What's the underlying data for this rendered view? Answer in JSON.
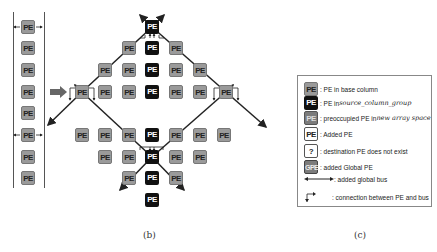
{
  "pe_label": "PE",
  "left_column": {
    "pes": [
      {
        "y": 27,
        "global": true
      },
      {
        "y": 48,
        "global": false
      },
      {
        "y": 70,
        "global": false
      },
      {
        "y": 92,
        "global": false
      },
      {
        "y": 113,
        "global": false
      },
      {
        "y": 135,
        "global": true
      },
      {
        "y": 157,
        "global": false
      },
      {
        "y": 178,
        "global": false
      }
    ]
  },
  "main_diagram": {
    "global_nodes": [
      {
        "name": "top",
        "x": 152,
        "y": 27,
        "type": "src"
      },
      {
        "name": "left",
        "x": 82,
        "y": 92,
        "type": "base"
      },
      {
        "name": "right",
        "x": 226,
        "y": 92,
        "type": "base"
      },
      {
        "name": "bottom",
        "x": 152,
        "y": 157,
        "type": "src"
      }
    ],
    "pes": [
      {
        "x": 129,
        "y": 48,
        "type": "base"
      },
      {
        "x": 152,
        "y": 48,
        "type": "src"
      },
      {
        "x": 176,
        "y": 48,
        "type": "base"
      },
      {
        "x": 105,
        "y": 70,
        "type": "base"
      },
      {
        "x": 129,
        "y": 70,
        "type": "base"
      },
      {
        "x": 152,
        "y": 70,
        "type": "src"
      },
      {
        "x": 176,
        "y": 70,
        "type": "base"
      },
      {
        "x": 200,
        "y": 70,
        "type": "base"
      },
      {
        "x": 105,
        "y": 92,
        "type": "base"
      },
      {
        "x": 129,
        "y": 92,
        "type": "base"
      },
      {
        "x": 152,
        "y": 92,
        "type": "src"
      },
      {
        "x": 176,
        "y": 92,
        "type": "base"
      },
      {
        "x": 200,
        "y": 92,
        "type": "base"
      },
      {
        "x": 82,
        "y": 135,
        "type": "base"
      },
      {
        "x": 105,
        "y": 135,
        "type": "base"
      },
      {
        "x": 129,
        "y": 135,
        "type": "base"
      },
      {
        "x": 152,
        "y": 135,
        "type": "src"
      },
      {
        "x": 176,
        "y": 135,
        "type": "base"
      },
      {
        "x": 200,
        "y": 135,
        "type": "base"
      },
      {
        "x": 224,
        "y": 135,
        "type": "base"
      },
      {
        "x": 105,
        "y": 157,
        "type": "base"
      },
      {
        "x": 129,
        "y": 157,
        "type": "base"
      },
      {
        "x": 176,
        "y": 157,
        "type": "base"
      },
      {
        "x": 200,
        "y": 157,
        "type": "base"
      },
      {
        "x": 129,
        "y": 178,
        "type": "base"
      },
      {
        "x": 152,
        "y": 178,
        "type": "src"
      },
      {
        "x": 176,
        "y": 178,
        "type": "base"
      },
      {
        "x": 152,
        "y": 200,
        "type": "src"
      }
    ]
  },
  "legend": {
    "items": [
      {
        "swatch": "PE",
        "style": "base",
        "text": ": PE in base column",
        "italic": ""
      },
      {
        "swatch": "PE",
        "style": "src",
        "text": ": PE in ",
        "italic": "source_column_group"
      },
      {
        "swatch": "PE",
        "style": "occ",
        "text": ": preoccupied PE in ",
        "italic": "new array space"
      },
      {
        "swatch": "PE",
        "style": "added",
        "text": ": Added PE",
        "italic": ""
      },
      {
        "swatch": "?",
        "style": "q",
        "text": ": destination PE does not exist",
        "italic": ""
      },
      {
        "swatch": "GPE",
        "style": "gpe",
        "text": ": added Global PE",
        "italic": ""
      },
      {
        "swatch": "",
        "style": "bus",
        "text": ": added global bus",
        "italic": ""
      },
      {
        "swatch": "",
        "style": "conn",
        "text": ": connection between PE and bus",
        "italic": ""
      }
    ]
  },
  "captions": {
    "b": "(b)",
    "c": "(c)"
  }
}
